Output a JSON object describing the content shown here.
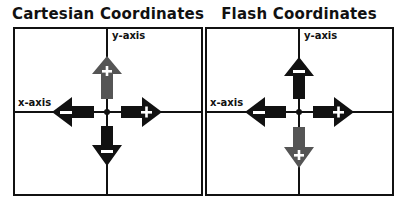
{
  "colors": {
    "dark": "#111111",
    "gray": "#555555",
    "sign": "#ffffff"
  },
  "panels": [
    {
      "title": "Cartesian Coordinates",
      "y_axis_label": "y-axis",
      "x_axis_label": "x-axis",
      "arrows": {
        "up": {
          "sign": "+",
          "color": "gray"
        },
        "down": {
          "sign": "−",
          "color": "dark"
        },
        "left": {
          "sign": "−",
          "color": "dark"
        },
        "right": {
          "sign": "+",
          "color": "dark"
        }
      }
    },
    {
      "title": "Flash Coordinates",
      "y_axis_label": "y-axis",
      "x_axis_label": "x-axis",
      "arrows": {
        "up": {
          "sign": "−",
          "color": "dark"
        },
        "down": {
          "sign": "+",
          "color": "gray"
        },
        "left": {
          "sign": "−",
          "color": "dark"
        },
        "right": {
          "sign": "+",
          "color": "dark"
        }
      }
    }
  ]
}
